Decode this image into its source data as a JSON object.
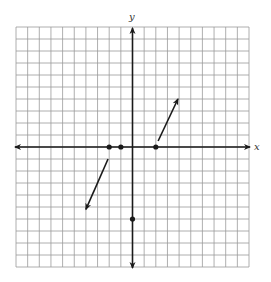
{
  "graph": {
    "axis_labels": {
      "x": "x",
      "y": "y"
    },
    "grid": {
      "xmin": -10,
      "xmax": 10,
      "ymin": -10,
      "ymax": 10,
      "step": 1
    },
    "colors": {
      "grid": "#9a9a9a",
      "axis": "#1a1a1a",
      "mark": "#1a1a1a"
    },
    "points": [
      {
        "x": -2,
        "y": 0
      },
      {
        "x": -1,
        "y": 0
      },
      {
        "x": 2,
        "y": 0
      },
      {
        "x": 0,
        "y": -6
      }
    ],
    "rays": [
      {
        "from": [
          2.2,
          0.5
        ],
        "to": [
          3.9,
          4.0
        ]
      },
      {
        "from": [
          -2.1,
          -1.0
        ],
        "to": [
          -4.0,
          -5.2
        ]
      }
    ]
  }
}
